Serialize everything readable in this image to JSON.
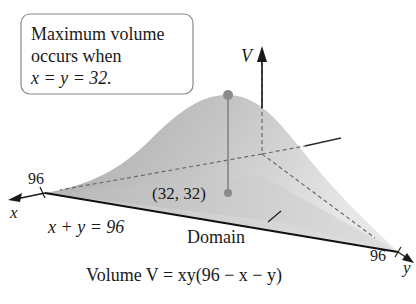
{
  "callout": {
    "line1": "Maximum volume",
    "line2": "occurs when",
    "line3": "x = y = 32."
  },
  "axes": {
    "v_label": "V",
    "x_label": "x",
    "y_label": "y",
    "x_tick": "96",
    "y_tick": "96"
  },
  "labels": {
    "max_point": "(32, 32)",
    "constraint": "x + y = 96",
    "domain": "Domain",
    "caption": "Volume V = xy(96 − x − y)"
  },
  "colors": {
    "surface_dark": "#9a9a9a",
    "surface_light": "#e4e4e4",
    "point": "#8a8a8a",
    "axis": "#1a1a1a"
  }
}
